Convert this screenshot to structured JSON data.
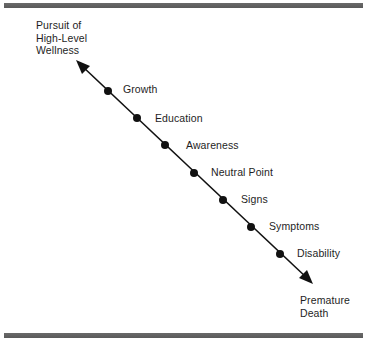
{
  "diagram": {
    "type": "illness-wellness continuum",
    "top_endpoint": {
      "label": "Pursuit of\nHigh-Level\nWellness"
    },
    "bottom_endpoint": {
      "label": "Premature\nDeath"
    },
    "points": [
      {
        "label": "Growth"
      },
      {
        "label": "Education"
      },
      {
        "label": "Awareness"
      },
      {
        "label": "Neutral Point"
      },
      {
        "label": "Signs"
      },
      {
        "label": "Symptoms"
      },
      {
        "label": "Disability"
      }
    ],
    "colors": {
      "line": "#111111",
      "dot": "#111111",
      "frame_bar": "#606060",
      "background": "#ffffff"
    }
  }
}
